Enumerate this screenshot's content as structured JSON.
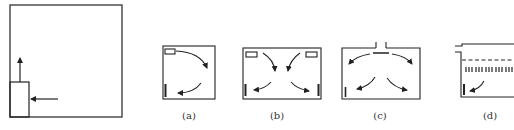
{
  "diagram": {
    "stroke_color": "#222222",
    "panels": [
      {
        "id": "main",
        "label": ""
      },
      {
        "id": "a",
        "label": "(a)"
      },
      {
        "id": "b",
        "label": "(b)"
      },
      {
        "id": "c",
        "label": "(c)"
      },
      {
        "id": "d",
        "label": "(d)"
      }
    ]
  }
}
